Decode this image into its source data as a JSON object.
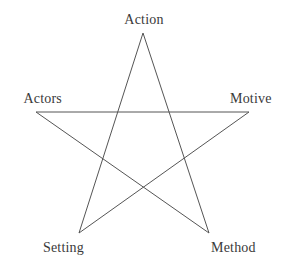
{
  "diagram": {
    "type": "pentagram",
    "title": "",
    "background_color": "#ffffff",
    "stroke_color": "#555555",
    "stroke_width": 1,
    "text_color": "#3a3a3a",
    "vertices": [
      {
        "id": "action",
        "label": "Action",
        "x": 143,
        "y": 33,
        "position": "top"
      },
      {
        "id": "motive",
        "label": "Motive",
        "x": 249,
        "y": 112,
        "position": "right"
      },
      {
        "id": "method",
        "label": "Method",
        "x": 209,
        "y": 233,
        "position": "bottom-right"
      },
      {
        "id": "setting",
        "label": "Setting",
        "x": 79,
        "y": 233,
        "position": "bottom-left"
      },
      {
        "id": "actors",
        "label": "Actors",
        "x": 36,
        "y": 112,
        "position": "left"
      }
    ],
    "edges": [
      {
        "from": "action",
        "to": "method"
      },
      {
        "from": "method",
        "to": "actors"
      },
      {
        "from": "actors",
        "to": "motive"
      },
      {
        "from": "motive",
        "to": "setting"
      },
      {
        "from": "setting",
        "to": "action"
      }
    ],
    "path_points": "143,33 209,233 36,112 249,112 79,233 143,33"
  }
}
